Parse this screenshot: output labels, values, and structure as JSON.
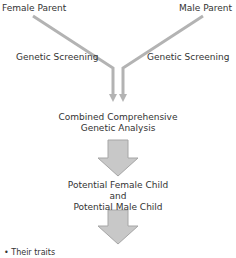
{
  "diagram": {
    "nodes": {
      "female_parent": "Female Parent",
      "male_parent": "Male Parent",
      "left_edge_label": "Genetic Screening",
      "right_edge_label": "Genetic Screening",
      "combined_line1": "Combined Comprehensive",
      "combined_line2": "Genetic Analysis",
      "child_line1": "Potential Female Child",
      "child_line2": "and",
      "child_line3": "Potential Male Child",
      "bullet_text": "Their traits"
    },
    "colors": {
      "line": "#b3b3b3",
      "arrow_fill": "#c8c8c8",
      "arrow_stroke": "#a6a6a6",
      "text": "#333333"
    },
    "icons": {
      "bullet": "•"
    }
  }
}
